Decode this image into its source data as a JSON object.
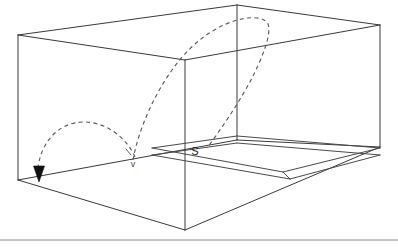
{
  "figure": {
    "background_color": "#ffffff",
    "line_color": "#3a3a3a",
    "dashed_color": "#5c5c5c",
    "label_color": "#1a1a1a",
    "baseline_color": "#8a8a8a",
    "width": 398,
    "height": 247
  },
  "labels": {
    "source_point": "S",
    "bounce_point": "v"
  },
  "box": {
    "name": "rectangular-enclosure",
    "vertices": {
      "top_back_left": [
        18,
        35
      ],
      "top_back_right": [
        237,
        5
      ],
      "top_front_right": [
        380,
        25
      ],
      "top_front_center": [
        185,
        60
      ],
      "bottom_front_left": [
        18,
        180
      ],
      "bottom_back_right": [
        237,
        140
      ],
      "bottom_front_right": [
        380,
        147
      ],
      "bottom_front_center": [
        185,
        230
      ]
    },
    "edges": [
      "top_back_left-top_back_right",
      "top_back_right-top_front_right",
      "top_front_right-top_front_center",
      "top_front_center-top_back_left",
      "top_back_left-bottom_front_left",
      "top_front_center-bottom_front_center",
      "top_front_right-bottom_front_right",
      "bottom_front_left-bottom_front_center",
      "bottom_front_center-bottom_front_right",
      "bottom_front_left-bottom_back_right",
      "bottom_back_right-bottom_front_right"
    ]
  },
  "slab": {
    "name": "floor-strip",
    "outer_quad": [
      [
        152,
        148
      ],
      [
        237,
        136
      ],
      [
        380,
        148
      ],
      [
        290,
        171
      ]
    ],
    "inner_quad": [
      [
        152,
        155
      ],
      [
        237,
        143
      ],
      [
        380,
        155
      ],
      [
        290,
        179
      ]
    ],
    "thickness_px": 7
  },
  "trajectories": [
    {
      "name": "long-arc",
      "style": "dashed",
      "from": [
        133,
        158
      ],
      "apex": [
        266,
        22
      ],
      "to": [
        205,
        147
      ],
      "description": "arc rising from floor bounce point over the top of the box and descending to S"
    },
    {
      "name": "short-arc",
      "style": "dashed",
      "from": [
        133,
        158
      ],
      "apex": [
        79,
        125
      ],
      "to": [
        39,
        169
      ],
      "description": "arc from floor bounce point to arrowhead at front-left bottom corner"
    }
  ],
  "arrow": {
    "name": "direction-arrow",
    "tip": [
      39,
      182
    ],
    "base_left": [
      34,
      167
    ],
    "base_right": [
      44,
      167
    ],
    "color": "#111111"
  },
  "baseline": {
    "name": "bottom-rule",
    "y": 240,
    "x_start": 0,
    "x_end": 398
  }
}
